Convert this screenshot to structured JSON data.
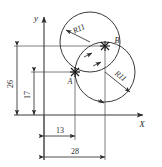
{
  "drawing": {
    "title": "engineering-sketch-two-tangent-circles",
    "background_color": "#ffffff",
    "line_color": "#3a3a3a",
    "text_color": "#2b2b2b"
  },
  "axes": {
    "x_label": "X",
    "y_label": "y",
    "origin_x": 44,
    "origin_y": 115
  },
  "points": [
    {
      "name": "A",
      "label": "A",
      "x": 75,
      "y": 72
    },
    {
      "name": "B",
      "label": "B",
      "x": 105,
      "y": 46
    }
  ],
  "circles": [
    {
      "name": "upper-circle",
      "cx": 90,
      "cy": 42,
      "r": 30,
      "radius_label": "R11"
    },
    {
      "name": "lower-circle",
      "cx": 105,
      "cy": 72,
      "r": 30,
      "radius_label": "R11"
    }
  ],
  "dimensions": [
    {
      "name": "dim-26",
      "value": "26",
      "orientation": "vertical"
    },
    {
      "name": "dim-17",
      "value": "17",
      "orientation": "vertical"
    },
    {
      "name": "dim-13",
      "value": "13",
      "orientation": "horizontal"
    },
    {
      "name": "dim-28",
      "value": "28",
      "orientation": "horizontal"
    }
  ],
  "radius_labels": {
    "upper": "R11",
    "lower": "R11"
  }
}
